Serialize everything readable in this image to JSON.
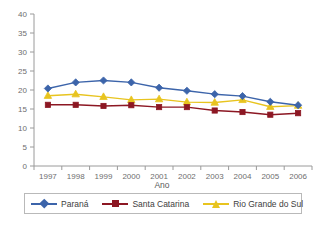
{
  "chart_data": {
    "type": "line",
    "title": "",
    "xlabel": "Ano",
    "ylabel": "",
    "categories": [
      "1997",
      "1998",
      "1999",
      "2000",
      "2001",
      "2002",
      "2003",
      "2004",
      "2005",
      "2006"
    ],
    "x": [
      1997,
      1998,
      1999,
      2000,
      2001,
      2002,
      2003,
      2004,
      2005,
      2006
    ],
    "ylim": [
      0,
      40
    ],
    "yticks": [
      "0",
      "5",
      "10",
      "15",
      "20",
      "25",
      "30",
      "35",
      "40"
    ],
    "grid": false,
    "legend_position": "bottom",
    "series": [
      {
        "name": "Paraná",
        "color": "#3c64aa",
        "marker": "diamond",
        "values": [
          20.4,
          22.0,
          22.5,
          22.0,
          20.6,
          19.8,
          18.9,
          18.4,
          16.9,
          16.0
        ]
      },
      {
        "name": "Santa Catarina",
        "color": "#8c1723",
        "marker": "square",
        "values": [
          16.1,
          16.1,
          15.8,
          16.0,
          15.5,
          15.5,
          14.6,
          14.2,
          13.5,
          13.9
        ]
      },
      {
        "name": "Rio Grande do Sul",
        "color": "#e8c41f",
        "marker": "triangle",
        "values": [
          18.5,
          18.9,
          18.2,
          17.4,
          17.6,
          16.8,
          16.7,
          17.4,
          15.6,
          15.9
        ]
      }
    ]
  },
  "axes": {
    "x_title": "Ano",
    "y_tick_labels": [
      "40",
      "35",
      "30",
      "25",
      "20",
      "15",
      "10",
      "5",
      "0"
    ],
    "x_tick_labels": [
      "1997",
      "1998",
      "1999",
      "2000",
      "2001",
      "2002",
      "2003",
      "2004",
      "2005",
      "2006"
    ]
  },
  "legend": {
    "items": [
      {
        "label": "Paraná",
        "color": "#3c64aa",
        "marker": "diamond"
      },
      {
        "label": "Santa Catarina",
        "color": "#8c1723",
        "marker": "square"
      },
      {
        "label": "Rio Grande do Sul",
        "color": "#e8c41f",
        "marker": "triangle"
      }
    ]
  },
  "caption": {
    "text": ""
  },
  "colors": {
    "axis": "#9a9a9a",
    "tick_text": "#6e6e6e",
    "background": "#ffffff"
  }
}
